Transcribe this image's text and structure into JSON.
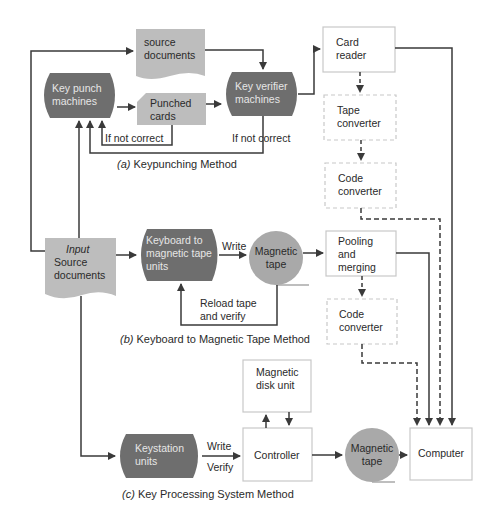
{
  "colors": {
    "dark_process": "#6e6e6e",
    "light_document": "#bdbdbd",
    "tape_circle": "#a9a9a9",
    "line": "#3a3a3a",
    "box_border": "#c8c8c8",
    "text": "#2a2a2a"
  },
  "section_a": {
    "caption_prefix": "(a)",
    "caption": "Keypunching Method",
    "source_documents": "source documents",
    "key_punch": "Key punch machines",
    "punched_cards": "Punched cards",
    "key_verifier": "Key verifier machines",
    "card_reader": "Card reader",
    "tape_converter": "Tape converter",
    "code_converter": "Code converter",
    "if_not_correct_1": "If not correct",
    "if_not_correct_2": "If not correct"
  },
  "section_b": {
    "caption_prefix": "(b)",
    "caption": "Keyboard to Magnetic Tape Method",
    "input_title": "Input",
    "input_body": "Source documents",
    "keyboard": "Keyboard to magnetic tape units",
    "write_label": "Write",
    "magnetic_tape": "Magnetic tape",
    "reload": "Reload tape and verify",
    "pooling": "Pooling and merging",
    "code_converter": "Code converter"
  },
  "section_c": {
    "caption_prefix": "(c)",
    "caption": "Key Processing System Method",
    "keystation": "Keystation units",
    "write_label": "Write",
    "verify_label": "Verify",
    "controller": "Controller",
    "disk_unit": "Magnetic disk unit",
    "magnetic_tape": "Magnetic tape",
    "computer": "Computer"
  }
}
